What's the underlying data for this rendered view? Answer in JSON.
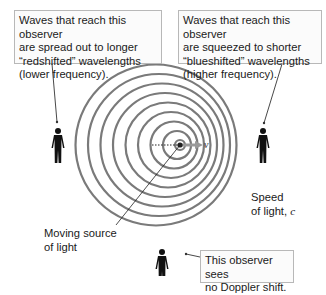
{
  "callouts": {
    "redshift": {
      "lines": [
        "Waves that reach this observer",
        "are spread out to longer",
        "“redshifted” wavelengths",
        "(lower frequency)."
      ]
    },
    "blueshift": {
      "lines": [
        "Waves that reach this observer",
        "are squeezed to shorter",
        "“blueshifted” wavelengths",
        "(higher frequency)."
      ]
    },
    "no_shift": {
      "lines": [
        "This observer sees",
        "no Doppler shift."
      ]
    }
  },
  "labels": {
    "source": [
      "Moving source",
      "of light"
    ],
    "speed": [
      "Speed",
      "of light, "
    ],
    "speed_symbol": "c",
    "velocity_symbol": "v"
  },
  "colors": {
    "wavefront": "#7a7a7a",
    "box_border": "#b8b8b8",
    "text": "#1a1a1a",
    "figure": "#111111"
  }
}
